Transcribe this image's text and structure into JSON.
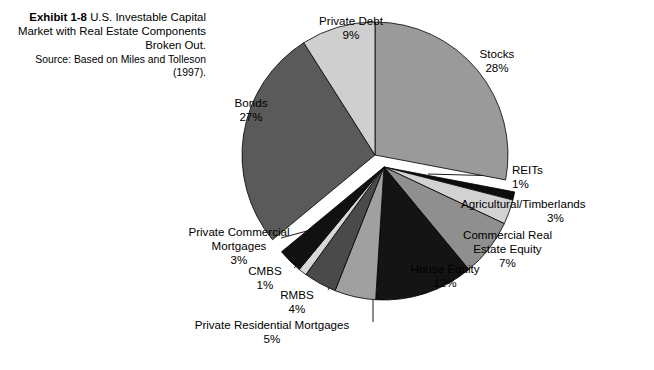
{
  "caption": {
    "exhibit_label": "Exhibit 1-8",
    "title": "U.S. Investable Capital Market with Real Estate Components Broken Out.",
    "source": "Source: Based on Miles and Tolleson (1997)."
  },
  "chart_data": {
    "type": "pie",
    "title": "U.S. Investable Capital Market with Real Estate Components Broken Out.",
    "units": "percent",
    "total": 100,
    "legend": "none",
    "labels_position": "outside",
    "exploded": true,
    "groups": [
      {
        "name": "financial-assets",
        "offset": "up-left",
        "slice_names": [
          "Stocks",
          "Private Debt",
          "Bonds"
        ]
      },
      {
        "name": "real-estate-components",
        "offset": "down-right",
        "slice_names": [
          "REITs",
          "Agricultural/Timberlands",
          "Commercial Real Estate Equity",
          "House Equity",
          "Private Residential Mortgages",
          "RMBS",
          "CMBS",
          "Private Commercial Mortgages"
        ]
      }
    ],
    "categories": [
      "Stocks",
      "REITs",
      "Agricultural/Timberlands",
      "Commercial Real Estate Equity",
      "House Equity",
      "Private Residential Mortgages",
      "RMBS",
      "CMBS",
      "Private Commercial Mortgages",
      "Bonds",
      "Private Debt"
    ],
    "values": [
      28,
      1,
      3,
      7,
      12,
      5,
      4,
      1,
      3,
      27,
      9
    ],
    "colors": [
      "#9a9a9a",
      "#0d0d0d",
      "#d2d2d2",
      "#8f8f8f",
      "#141414",
      "#a0a0a0",
      "#4a4a4a",
      "#d8d8d8",
      "#111111",
      "#5a5a5a",
      "#cfcfcf"
    ],
    "slices": [
      {
        "label": "Stocks",
        "value": 28,
        "pct_text": "28%",
        "color": "#9a9a9a"
      },
      {
        "label": "REITs",
        "value": 1,
        "pct_text": "1%",
        "color": "#0d0d0d"
      },
      {
        "label": "Agricultural/Timberlands",
        "value": 3,
        "pct_text": "3%",
        "color": "#d2d2d2"
      },
      {
        "label": "Commercial Real Estate Equity",
        "value": 7,
        "pct_text": "7%",
        "color": "#8f8f8f"
      },
      {
        "label": "House Equity",
        "value": 12,
        "pct_text": "12%",
        "color": "#141414"
      },
      {
        "label": "Private Residential Mortgages",
        "value": 5,
        "pct_text": "5%",
        "color": "#a0a0a0"
      },
      {
        "label": "RMBS",
        "value": 4,
        "pct_text": "4%",
        "color": "#4a4a4a"
      },
      {
        "label": "CMBS",
        "value": 1,
        "pct_text": "1%",
        "color": "#d8d8d8"
      },
      {
        "label": "Private Commercial Mortgages",
        "value": 3,
        "pct_text": "3%",
        "color": "#111111"
      },
      {
        "label": "Bonds",
        "value": 27,
        "pct_text": "27%",
        "color": "#5a5a5a"
      },
      {
        "label": "Private Debt",
        "value": 9,
        "pct_text": "9%",
        "color": "#cfcfcf"
      }
    ]
  },
  "labels": {
    "private_debt": {
      "name": "Private Debt",
      "pct": "9%"
    },
    "stocks": {
      "name": "Stocks",
      "pct": "28%"
    },
    "bonds": {
      "name": "Bonds",
      "pct": "27%"
    },
    "reits": {
      "name": "REITs",
      "pct": "1%"
    },
    "agricultural": {
      "name": "Agricultural/Timberlands",
      "pct": "3%"
    },
    "commercial_equity": {
      "name_line1": "Commercial Real",
      "name_line2": "Estate Equity",
      "pct": "7%"
    },
    "house_equity": {
      "name": "House Equity",
      "pct": "12%"
    },
    "priv_comm_mort": {
      "name_line1": "Private Commercial",
      "name_line2": "Mortgages",
      "pct": "3%"
    },
    "cmbs": {
      "name": "CMBS",
      "pct": "1%"
    },
    "rmbs": {
      "name": "RMBS",
      "pct": "4%"
    },
    "priv_res_mort": {
      "name": "Private Residential Mortgages",
      "pct": "5%"
    }
  }
}
